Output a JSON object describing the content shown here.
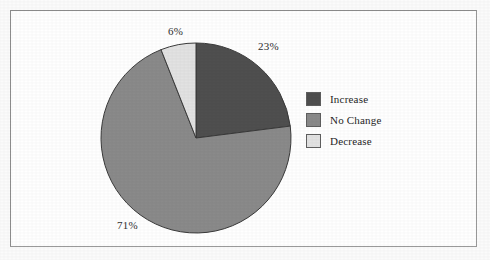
{
  "figure": {
    "frame_color": "#8d8d8d",
    "background": "#ffffff"
  },
  "chart_data": {
    "type": "pie",
    "title": "",
    "subtitle": "",
    "xlabel": "",
    "ylabel": "",
    "grid": false,
    "legend_position": "right",
    "start_angle_deg": 0,
    "direction": "clockwise",
    "categories": [
      "Increase",
      "No Change",
      "Decrease"
    ],
    "values": [
      23,
      71,
      6
    ],
    "value_unit": "%",
    "data_labels": [
      "23%",
      "71%",
      "6%"
    ],
    "colors": [
      "#4f4f4f",
      "#8a8a8a",
      "#e2e2e2"
    ],
    "slices": [
      {
        "label": "Increase",
        "value": 23,
        "data_label": "23%",
        "color": "#4f4f4f",
        "start_deg": 0,
        "end_deg": 82.8
      },
      {
        "label": "No Change",
        "value": 71,
        "data_label": "71%",
        "color": "#8a8a8a",
        "start_deg": 82.8,
        "end_deg": 338.4
      },
      {
        "label": "Decrease",
        "value": 6,
        "data_label": "6%",
        "color": "#e2e2e2",
        "start_deg": 338.4,
        "end_deg": 360
      }
    ],
    "legend": [
      {
        "label": "Increase",
        "color": "#4f4f4f"
      },
      {
        "label": "No Change",
        "color": "#8a8a8a"
      },
      {
        "label": "Decrease",
        "color": "#e2e2e2"
      }
    ]
  },
  "labels": {
    "decrease_pct": "6%",
    "increase_pct": "23%",
    "nochange_pct": "71%"
  },
  "legend": {
    "items": [
      {
        "label": "Increase"
      },
      {
        "label": "No Change"
      },
      {
        "label": "Decrease"
      }
    ]
  }
}
